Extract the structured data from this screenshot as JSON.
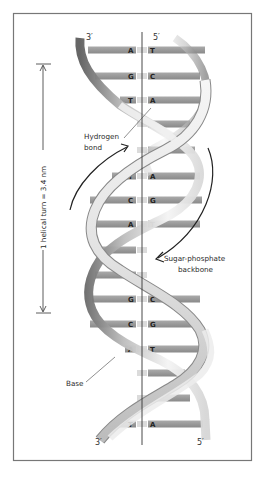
{
  "diagram": {
    "frame": {
      "x": 13,
      "y": 13,
      "width": 239,
      "height": 448,
      "stroke": "#777777"
    },
    "axis": {
      "x": 142,
      "y1": 32,
      "y2": 445
    },
    "ends": {
      "top_left": "3′",
      "top_right": "5′",
      "bottom_left": "3′",
      "bottom_right": "5′"
    },
    "measurement": {
      "label": "1 helical turn = 3.4 nm",
      "x": 43,
      "y_top": 64,
      "y_bottom": 313
    },
    "labels": {
      "hydrogen_bond_line1": "Hydrogen",
      "hydrogen_bond_line2": "bond",
      "backbone_line1": "Sugar-phosphate",
      "backbone_line2": "backbone",
      "base": "Base"
    },
    "colors": {
      "base_bar": "#9a9a9a",
      "base_bar_dark": "#7d7d7d",
      "ribbon_light": "#f2f2f2",
      "ribbon_mid": "#c8c8c8",
      "ribbon_dark": "#6e6e6e",
      "line": "#333333"
    },
    "base_pairs": [
      {
        "y": 50,
        "left": "A",
        "right": "T",
        "x1": 88,
        "x2": 205,
        "visible": true
      },
      {
        "y": 76,
        "left": "G",
        "right": "C",
        "x1": 95,
        "x2": 200,
        "visible": true
      },
      {
        "y": 100,
        "left": "T",
        "right": "A",
        "x1": 120,
        "x2": 200,
        "visible": true
      },
      {
        "y": 124,
        "left": "",
        "right": "",
        "x1": 150,
        "x2": 190,
        "visible": false
      },
      {
        "y": 150,
        "left": "",
        "right": "",
        "x1": 150,
        "x2": 195,
        "visible": false
      },
      {
        "y": 176,
        "left": "T",
        "right": "A",
        "x1": 112,
        "x2": 200,
        "visible": true
      },
      {
        "y": 200,
        "left": "C",
        "right": "G",
        "x1": 90,
        "x2": 202,
        "visible": true
      },
      {
        "y": 224,
        "left": "A",
        "right": "T",
        "x1": 90,
        "x2": 200,
        "visible": true
      },
      {
        "y": 250,
        "left": "",
        "right": "",
        "x1": 100,
        "x2": 140,
        "visible": false
      },
      {
        "y": 275,
        "left": "",
        "right": "",
        "x1": 95,
        "x2": 135,
        "visible": false
      },
      {
        "y": 299,
        "left": "G",
        "right": "C",
        "x1": 92,
        "x2": 200,
        "visible": true
      },
      {
        "y": 324,
        "left": "C",
        "right": "G",
        "x1": 90,
        "x2": 200,
        "visible": true
      },
      {
        "y": 349,
        "left": "A",
        "right": "T",
        "x1": 125,
        "x2": 200,
        "visible": true
      },
      {
        "y": 373,
        "left": "",
        "right": "",
        "x1": 155,
        "x2": 185,
        "visible": false
      },
      {
        "y": 398,
        "left": "",
        "right": "",
        "x1": 155,
        "x2": 190,
        "visible": false
      },
      {
        "y": 424,
        "left": "T",
        "right": "A",
        "x1": 115,
        "x2": 203,
        "visible": true
      }
    ]
  }
}
